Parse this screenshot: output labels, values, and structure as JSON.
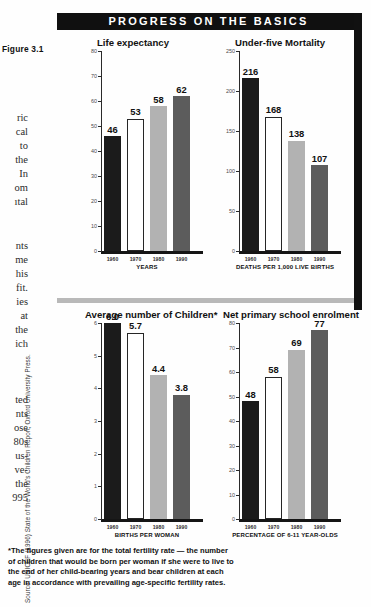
{
  "figure": {
    "label": "Figure 3.1",
    "banner_title": "PROGRESS ON THE BASICS",
    "source": "Source: UNICEF (1996) State of the World's Children Report, Oxford University Press."
  },
  "body_fragments": [
    "ric",
    "cal",
    "to",
    "the",
    "In",
    "om",
    "ıtal",
    "nts",
    "me",
    "his",
    "fit.",
    "ies",
    "at",
    "the",
    "ich",
    "ted",
    "nts",
    "ose",
    "80s",
    "us-",
    "ve-",
    "the",
    "995"
  ],
  "footnote": {
    "lines": [
      "*The figures given are for the total fertility rate — the number",
      "of children that would be born per woman if she were to live to",
      "the end of her child-bearing years and bear children at each",
      "age in accordance with prevailing age-specific fertility rates."
    ]
  },
  "colors": {
    "banner_bg": "#101010",
    "bar_1960": "#1b1b1b",
    "bar_1970": "#ffffff",
    "bar_1980": "#b2b2b2",
    "bar_1990": "#5c5c5c",
    "separator": "#b9b9b9"
  },
  "chart_data": [
    {
      "type": "bar",
      "id": "life-expectancy",
      "title": "Life expectancy",
      "categories": [
        "1960",
        "1970",
        "1980",
        "1990"
      ],
      "values": [
        46,
        53,
        58,
        62
      ],
      "value_labels": [
        "46",
        "53",
        "58",
        "62"
      ],
      "xlabel": "YEARS",
      "ylabel": "",
      "ylim": [
        0,
        80
      ],
      "yticks": [
        0,
        10,
        20,
        30,
        40,
        50,
        60,
        70,
        80
      ],
      "ytick_labels": [
        "0",
        "10",
        "20",
        "30",
        "40",
        "50",
        "60",
        "70",
        "80"
      ],
      "grid": false,
      "legend": false
    },
    {
      "type": "bar",
      "id": "under-five-mortality",
      "title": "Under-five Mortality",
      "categories": [
        "1960",
        "1970",
        "1980",
        "1990"
      ],
      "values": [
        216,
        168,
        138,
        107
      ],
      "value_labels": [
        "216",
        "168",
        "138",
        "107"
      ],
      "xlabel": "DEATHS PER 1,000 LIVE BIRTHS",
      "ylabel": "",
      "ylim": [
        0,
        250
      ],
      "yticks": [
        0,
        50,
        100,
        150,
        200,
        250
      ],
      "ytick_labels": [
        "0",
        "50",
        "100",
        "150",
        "200",
        "250"
      ],
      "grid": false,
      "legend": false
    },
    {
      "type": "bar",
      "id": "average-number-of-children",
      "title": "Average number of Children*",
      "categories": [
        "1960",
        "1970",
        "1980",
        "1990"
      ],
      "values": [
        6.0,
        5.7,
        4.4,
        3.8
      ],
      "value_labels": [
        "6.0",
        "5.7",
        "4.4",
        "3.8"
      ],
      "xlabel": "BIRTHS PER WOMAN",
      "ylabel": "",
      "ylim": [
        0,
        6
      ],
      "yticks": [
        0,
        1,
        2,
        3,
        4,
        5,
        6
      ],
      "ytick_labels": [
        "0",
        "1",
        "2",
        "3",
        "4",
        "5",
        "6"
      ],
      "grid": false,
      "legend": false
    },
    {
      "type": "bar",
      "id": "net-primary-school-enrolment",
      "title": "Net primary school enrolment",
      "categories": [
        "1960",
        "1970",
        "1980",
        "1990"
      ],
      "values": [
        48,
        58,
        69,
        77
      ],
      "value_labels": [
        "48",
        "58",
        "69",
        "77"
      ],
      "xlabel": "PERCENTAGE OF 6-11 YEAR-OLDS",
      "ylabel": "",
      "ylim": [
        0,
        80
      ],
      "yticks": [
        0,
        10,
        20,
        30,
        40,
        50,
        60,
        70,
        80
      ],
      "ytick_labels": [
        "0",
        "10",
        "20",
        "30",
        "40",
        "50",
        "60",
        "70",
        "80"
      ],
      "grid": false,
      "legend": false
    }
  ]
}
